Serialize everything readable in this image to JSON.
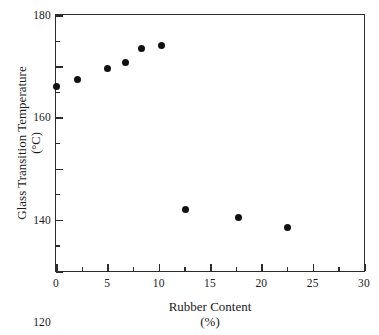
{
  "chart_data": {
    "type": "scatter",
    "title": "",
    "xlabel": "Rubber Content",
    "xlabel_unit": "(%)",
    "ylabel": "Glass Transition Temperature",
    "ylabel_unit": "(°C)",
    "xlim": [
      0,
      30
    ],
    "ylim": [
      80,
      180
    ],
    "grid": false,
    "legend": null,
    "x_ticks": [
      0,
      5,
      10,
      15,
      20,
      25,
      30
    ],
    "x_tick_labels": [
      "0",
      "5",
      "10",
      "15",
      "20",
      "25",
      "30"
    ],
    "x_minor_ticks": [
      2.5,
      7.5,
      12.5,
      17.5,
      22.5,
      27.5
    ],
    "y_ticks": [
      80,
      100,
      120,
      140,
      160,
      180
    ],
    "y_tick_labels": [
      "80",
      "100",
      "120",
      "140",
      "160",
      "180"
    ],
    "y_minor_ticks": [
      90,
      110,
      130,
      150,
      170
    ],
    "marker": "filled-circle",
    "marker_color": "#111111",
    "points": [
      {
        "x": 0.0,
        "y": 152
      },
      {
        "x": 2.1,
        "y": 155
      },
      {
        "x": 5.0,
        "y": 159
      },
      {
        "x": 6.8,
        "y": 161.5
      },
      {
        "x": 8.3,
        "y": 167
      },
      {
        "x": 10.3,
        "y": 168
      },
      {
        "x": 12.6,
        "y": 104
      },
      {
        "x": 17.8,
        "y": 101
      },
      {
        "x": 22.5,
        "y": 97
      }
    ],
    "series": [
      {
        "name": "Glass transition temperature",
        "x": [
          0.0,
          2.1,
          5.0,
          6.8,
          8.3,
          10.3,
          12.6,
          17.8,
          22.5
        ],
        "values": [
          152,
          155,
          159,
          161.5,
          167,
          168,
          104,
          101,
          97
        ]
      }
    ]
  }
}
